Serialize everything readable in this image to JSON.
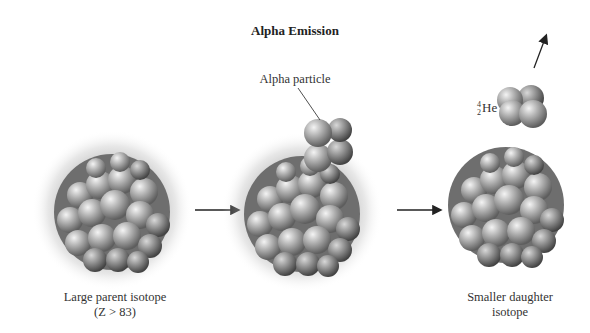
{
  "diagram": {
    "title": "Alpha Emission",
    "stages": [
      {
        "name": "parent",
        "label_line1": "Large parent isotope",
        "label_line2": "(Z > 83)"
      },
      {
        "name": "emitting",
        "callout": "Alpha particle"
      },
      {
        "name": "daughter",
        "label_line1": "Smaller daughter",
        "label_line2": "isotope"
      }
    ],
    "emitted_particle": {
      "mass_number": "4",
      "atomic_number": "2",
      "symbol": "He"
    },
    "arrows": [
      "parent-to-emitting",
      "emitting-to-daughter",
      "alpha-particle-direction"
    ],
    "colors": {
      "background": "#ffffff",
      "nucleon": "#9a9a9a",
      "halo": "#c8c8c8",
      "text": "#222222"
    }
  }
}
